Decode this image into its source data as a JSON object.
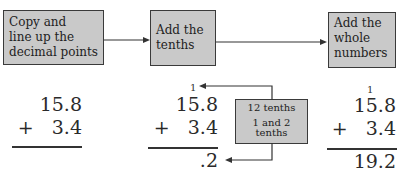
{
  "steps": [
    {
      "label_lines": [
        "Copy and",
        "line up the",
        "decimal points"
      ]
    },
    {
      "label_lines": [
        "Add the",
        "tenths"
      ]
    },
    {
      "label_lines": [
        "Add the",
        "whole",
        "numbers"
      ]
    }
  ],
  "problems": [
    {
      "carry": "",
      "top": "15.8",
      "bottom": "+   3.4",
      "result": ""
    },
    {
      "carry": "1",
      "top": "15.8",
      "bottom": "+   3.4",
      "result": ".2"
    },
    {
      "carry": "1",
      "top": "15.8",
      "bottom": "+   3.4",
      "result": "19.2"
    }
  ],
  "note": {
    "line1": "12 tenths",
    "line2": "1 and 2",
    "line3": "tenths"
  },
  "colors": {
    "box_fill": "#c9c9c9",
    "box_border": "#3a3a3a",
    "line": "#333333"
  }
}
